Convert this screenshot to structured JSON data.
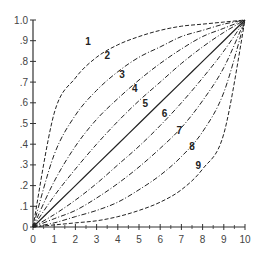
{
  "chart_data": {
    "type": "line",
    "title": "",
    "xlabel": "",
    "ylabel": "",
    "xlim": [
      0,
      10
    ],
    "ylim": [
      0,
      1.0
    ],
    "grid": false,
    "legend": "inline numeric labels on curves",
    "x_ticks": [
      "0",
      "1",
      "2",
      "3",
      "4",
      "5",
      "6",
      "7",
      "8",
      "9",
      "10"
    ],
    "y_ticks": [
      "0",
      ".1",
      ".2",
      ".3",
      ".4",
      ".5",
      ".6",
      ".7",
      ".8",
      ".9",
      "1.0"
    ],
    "x": [
      0,
      1,
      2,
      3,
      4,
      5,
      6,
      7,
      8,
      9,
      10
    ],
    "series": [
      {
        "name": "1",
        "style": "dashed",
        "values": [
          0,
          0.55,
          0.72,
          0.82,
          0.88,
          0.92,
          0.95,
          0.97,
          0.98,
          0.99,
          1.0
        ]
      },
      {
        "name": "2",
        "style": "dash-dot",
        "values": [
          0,
          0.35,
          0.54,
          0.66,
          0.75,
          0.82,
          0.87,
          0.92,
          0.95,
          0.98,
          1.0
        ]
      },
      {
        "name": "3",
        "style": "dash-dot",
        "values": [
          0,
          0.22,
          0.39,
          0.52,
          0.62,
          0.71,
          0.79,
          0.86,
          0.92,
          0.96,
          1.0
        ]
      },
      {
        "name": "4",
        "style": "dash-dot",
        "values": [
          0,
          0.15,
          0.28,
          0.4,
          0.51,
          0.61,
          0.7,
          0.79,
          0.87,
          0.94,
          1.0
        ]
      },
      {
        "name": "5",
        "style": "solid",
        "values": [
          0,
          0.1,
          0.2,
          0.3,
          0.4,
          0.5,
          0.6,
          0.7,
          0.8,
          0.9,
          1.0
        ]
      },
      {
        "name": "6",
        "style": "dash-dot",
        "values": [
          0,
          0.06,
          0.13,
          0.21,
          0.3,
          0.39,
          0.49,
          0.6,
          0.72,
          0.85,
          1.0
        ]
      },
      {
        "name": "7",
        "style": "dash-dot",
        "values": [
          0,
          0.04,
          0.08,
          0.14,
          0.21,
          0.29,
          0.38,
          0.48,
          0.61,
          0.77,
          1.0
        ]
      },
      {
        "name": "8",
        "style": "dash-dot",
        "values": [
          0,
          0.02,
          0.05,
          0.08,
          0.12,
          0.18,
          0.25,
          0.34,
          0.46,
          0.65,
          1.0
        ]
      },
      {
        "name": "9",
        "style": "dashed",
        "values": [
          0,
          0.01,
          0.02,
          0.03,
          0.05,
          0.08,
          0.12,
          0.18,
          0.28,
          0.45,
          1.0
        ]
      }
    ],
    "annotations": [
      {
        "text": "1",
        "x": 2.6,
        "y": 0.88
      },
      {
        "text": "2",
        "x": 3.5,
        "y": 0.81
      },
      {
        "text": "3",
        "x": 4.2,
        "y": 0.72
      },
      {
        "text": "4",
        "x": 4.8,
        "y": 0.65
      },
      {
        "text": "5",
        "x": 5.3,
        "y": 0.58
      },
      {
        "text": "6",
        "x": 6.2,
        "y": 0.53
      },
      {
        "text": "7",
        "x": 6.9,
        "y": 0.45
      },
      {
        "text": "8",
        "x": 7.5,
        "y": 0.37
      },
      {
        "text": "9",
        "x": 7.8,
        "y": 0.28
      }
    ]
  },
  "colors": {
    "axis": "#333333",
    "curve": "#222222",
    "background": "#ffffff"
  },
  "caption": ""
}
